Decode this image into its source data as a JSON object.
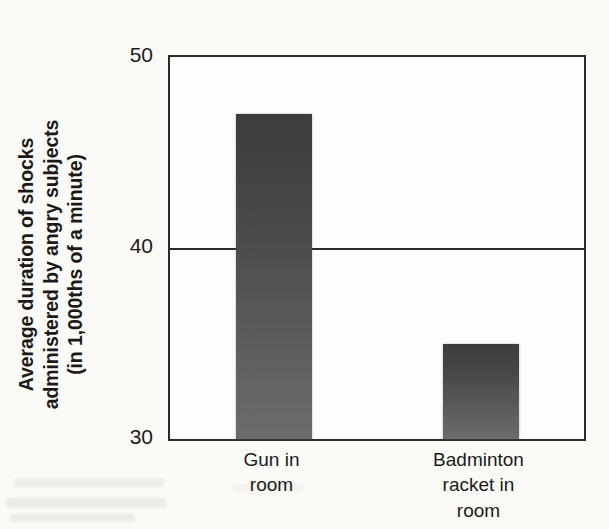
{
  "chart_data": {
    "type": "bar",
    "title": "",
    "subtitle": "",
    "xlabel": "",
    "ylabel": "Average duration of shocks administered by angry subjects (in 1,000ths of a minute)",
    "ylabel_lines": [
      "Average duration of shocks",
      "administered by angry subjects",
      "(in 1,000ths of a minute)"
    ],
    "categories": [
      "Gun in room",
      "Badminton racket in room"
    ],
    "category_lines": [
      [
        "Gun in",
        "room"
      ],
      [
        "Badminton",
        "racket in",
        "room"
      ]
    ],
    "values": [
      47,
      35
    ],
    "ylim": [
      30,
      50
    ],
    "yticks": [
      50,
      40,
      30
    ],
    "ytick_labels": [
      "50",
      "40",
      "30"
    ],
    "gridlines": [
      40
    ],
    "grid": true,
    "legend": "none",
    "bar_color": "#474747",
    "axis_color": "#2b2b2b",
    "background_color": "#fbfaf7"
  }
}
